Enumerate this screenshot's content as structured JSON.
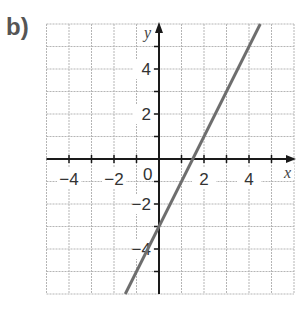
{
  "part_label": "b)",
  "chart_data": {
    "type": "line",
    "title": "",
    "xlabel": "x",
    "ylabel": "y",
    "xlim": [
      -5,
      6
    ],
    "ylim": [
      -6,
      6
    ],
    "grid": true,
    "x_tick_labels": [
      "−4",
      "−2",
      "2",
      "4"
    ],
    "x_tick_values": [
      -4,
      -2,
      2,
      4
    ],
    "y_tick_labels": [
      "4",
      "2",
      "−2",
      "−4"
    ],
    "y_tick_values": [
      4,
      2,
      -2,
      -4
    ],
    "origin_label": "0",
    "series": [
      {
        "name": "y = 2x − 3",
        "equation": "y = 2x - 3",
        "x": [
          -1.5,
          0,
          1.5,
          4.5
        ],
        "y": [
          -6,
          -3,
          0,
          6
        ],
        "color": "#6e6e6e"
      }
    ]
  },
  "colors": {
    "grid": "#b5b5b5",
    "axis": "#1a1a1a",
    "line": "#6e6e6e",
    "label": "#555555"
  }
}
